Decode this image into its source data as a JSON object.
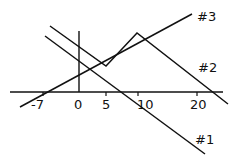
{
  "diagram": {
    "axis_ticks": [
      {
        "label": "-7",
        "x": 43
      },
      {
        "label": "0",
        "x": 79
      },
      {
        "label": "5",
        "x": 106
      },
      {
        "label": "10",
        "x": 138
      },
      {
        "label": "20",
        "x": 197
      }
    ],
    "lines": [
      {
        "label": "#1",
        "points": "45,36 205,154"
      },
      {
        "label": "#2",
        "points": "50,26 106,66 137,33 228,104"
      },
      {
        "label": "#3",
        "points": "20,107 192,14"
      }
    ],
    "line_labels": {
      "l1": "#1",
      "l2": "#2",
      "l3": "#3"
    },
    "tick_labels": {
      "t0": "-7",
      "t1": "0",
      "t2": "5",
      "t3": "10",
      "t4": "20"
    },
    "stroke_color": "#111111"
  }
}
